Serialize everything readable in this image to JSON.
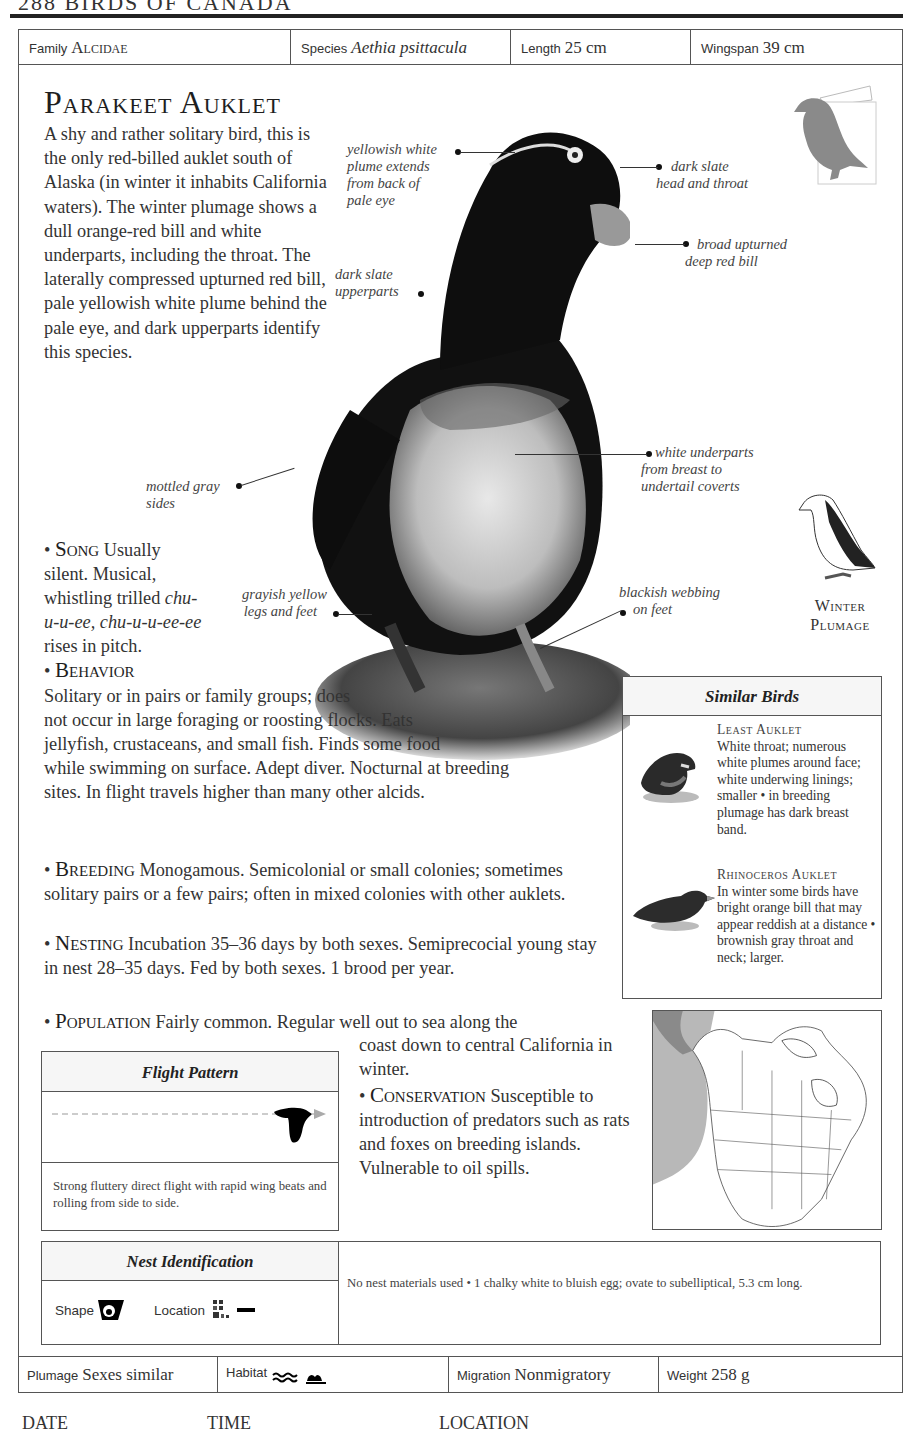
{
  "page": {
    "running_head": "288    BIRDS OF CANADA"
  },
  "info": {
    "family_label": "Family",
    "family_value": "Alcidae",
    "species_label": "Species",
    "species_value": "Aethia psittacula",
    "length_label": "Length",
    "length_value": "25 cm",
    "wingspan_label": "Wingspan",
    "wingspan_value": "39 cm"
  },
  "title": "Parakeet Auklet",
  "intro": "A shy and rather solitary bird, this is the only red-billed auklet south of Alaska (in winter it inhabits California waters). The winter plumage shows a dull orange-red bill and white underparts, including the throat. The laterally compressed upturned red bill, pale yellowish white plume behind the pale eye, and dark upperparts identify this species.",
  "callouts": [
    {
      "lines": [
        "yellowish white",
        "plume extends",
        "from back of",
        "pale eye"
      ]
    },
    {
      "lines": [
        "dark slate",
        "head and throat"
      ]
    },
    {
      "lines": [
        "broad upturned",
        "deep red bill"
      ]
    },
    {
      "lines": [
        "dark slate",
        "upperparts"
      ]
    },
    {
      "lines": [
        "white underparts",
        "from breast to",
        "undertail coverts"
      ]
    },
    {
      "lines": [
        "mottled gray",
        "sides"
      ]
    },
    {
      "lines": [
        "grayish yellow",
        "legs and feet"
      ]
    },
    {
      "lines": [
        "blackish webbing",
        "on feet"
      ]
    }
  ],
  "winter_plumage": {
    "line1": "Winter",
    "line2": "Plumage"
  },
  "sections": {
    "song": {
      "heading": "Song",
      "text1": " Usually silent. Musical, whistling trilled ",
      "call": "chu-u-u-ee, chu-u-u-ee-ee",
      "text2": " rises in pitch."
    },
    "behavior": {
      "heading": "Behavior",
      "text": "Solitary or in pairs or family groups; does not occur in large foraging or roosting flocks. Eats jellyfish, crustaceans, and small fish. Finds some food while swimming on surface. Adept diver. Nocturnal at breeding sites. In flight travels higher than many other alcids."
    },
    "breeding": {
      "heading": "Breeding",
      "text": " Monogamous. Semicolonial or small colonies; sometimes solitary pairs or a few pairs; often in mixed colonies with other auklets."
    },
    "nesting": {
      "heading": "Nesting",
      "text": " Incubation 35–36 days by both sexes. Semiprecocial young stay in nest 28–35 days. Fed by both sexes. 1 brood per year."
    },
    "population": {
      "heading": "Population",
      "text_a": " Fairly common. Regular well out to sea along the",
      "text_b": "coast down to central California in winter."
    },
    "conservation": {
      "heading": "Conservation",
      "text": " Susceptible to introduction of predators such as rats and foxes on breeding islands. Vulnerable to oil spills."
    }
  },
  "similar_birds": {
    "heading": "Similar Birds",
    "items": [
      {
        "name": "Least Auklet",
        "text": "White throat; numerous white plumes around face; white underwing linings; smaller • in breeding plumage has dark breast band."
      },
      {
        "name": "Rhinoceros Auklet",
        "text": "In winter some birds have bright orange bill that may appear reddish at a distance • brownish gray throat and neck; larger."
      }
    ]
  },
  "flight_pattern": {
    "heading": "Flight Pattern",
    "description": "Strong fluttery direct flight with rapid wing beats and rolling from side to side."
  },
  "nest_identification": {
    "heading": "Nest Identification",
    "shape_label": "Shape",
    "location_label": "Location",
    "description": "No nest materials used • 1 chalky white to bluish egg; ovate to subelliptical, 5.3 cm long."
  },
  "footer": {
    "plumage_label": "Plumage",
    "plumage_value": "Sexes similar",
    "habitat_label": "Habitat",
    "migration_label": "Migration",
    "migration_value": "Nonmigratory",
    "weight_label": "Weight",
    "weight_value": "258 g"
  },
  "log": {
    "date_label": "DATE",
    "time_label": "TIME",
    "location_label": "LOCATION"
  },
  "colors": {
    "text": "#2a2a2a",
    "rule": "#222222",
    "border": "#555555",
    "header_fill": "#f6f6f6",
    "map_range": "#b8b8b8"
  }
}
